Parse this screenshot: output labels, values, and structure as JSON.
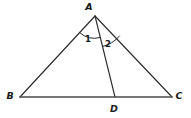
{
  "figure": {
    "background_color": "#ffffff",
    "stroke_color": "#2b2b2b",
    "base_stroke_color": "#4a4a4a",
    "label_color": "#1a1a1a",
    "width": 191,
    "height": 118
  },
  "vertices": {
    "a": {
      "label": "A",
      "x": 95,
      "y": 16,
      "label_x": 89,
      "label_y": 10
    },
    "b": {
      "label": "B",
      "x": 20,
      "y": 97,
      "label_x": 8,
      "label_y": 99
    },
    "c": {
      "label": "C",
      "x": 172,
      "y": 97,
      "label_x": 175,
      "label_y": 99
    },
    "d": {
      "label": "D",
      "x": 115,
      "y": 97,
      "label_x": 111,
      "label_y": 111
    }
  },
  "segments": [
    {
      "name": "side-ab",
      "from": "A",
      "to": "B"
    },
    {
      "name": "side-ac",
      "from": "A",
      "to": "C"
    },
    {
      "name": "base-bc",
      "from": "B",
      "to": "C"
    },
    {
      "name": "cevian-ad",
      "from": "A",
      "to": "D"
    }
  ],
  "angles": [
    {
      "label": "1",
      "at": "A",
      "between": "AB and AD",
      "label_x": 85,
      "label_y": 41
    },
    {
      "label": "2",
      "at": "A",
      "between": "AD and AC",
      "label_x": 105,
      "label_y": 47
    }
  ]
}
